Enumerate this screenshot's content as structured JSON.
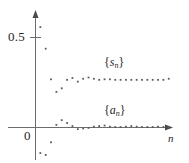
{
  "figure": {
    "name": "sequence-partial-sum-plot",
    "width": 189,
    "height": 163,
    "background_color": "#ffffff",
    "ink_color": "#5b5b5b"
  },
  "axes": {
    "x_axis_label": "n",
    "y_tick_label": "0.5",
    "origin_label": "0",
    "x_axis_pixel_y": 127,
    "y_axis_pixel_x": 35,
    "y_tick_pixel_y": 37
  },
  "labels": {
    "upper_series": {
      "open": "{",
      "var": "s",
      "sub": "n",
      "close": "}"
    },
    "lower_series": {
      "open": "{",
      "var": "a",
      "sub": "n",
      "close": "}"
    }
  },
  "chart_data": {
    "type": "scatter",
    "title": "",
    "subtitle": "",
    "xlabel": "n",
    "ylabel": "",
    "grid": false,
    "legend_position": "inline-annotation",
    "xlim": [
      0,
      26
    ],
    "ylim": [
      -0.22,
      0.62
    ],
    "yticks": [
      0.5
    ],
    "ytick_labels": [
      "0.5"
    ],
    "xticks": [],
    "annotations": [
      {
        "text": "{s_n}",
        "x": 13.0,
        "y": 0.3
      },
      {
        "text": "{a_n}",
        "x": 13.0,
        "y": 0.075
      }
    ],
    "series": [
      {
        "name": "{s_n}",
        "marker": "dot",
        "color": "#5b5b5b",
        "x": [
          1,
          2,
          3,
          4,
          5,
          6,
          7,
          8,
          9,
          10,
          11,
          12,
          13,
          14,
          15,
          16,
          17,
          18,
          19,
          20,
          21,
          22,
          23,
          24,
          25
        ],
        "y": [
          0.555,
          0.435,
          0.265,
          0.195,
          0.215,
          0.262,
          0.272,
          0.252,
          0.268,
          0.275,
          0.268,
          0.262,
          0.265,
          0.265,
          0.262,
          0.262,
          0.262,
          0.262,
          0.262,
          0.262,
          0.262,
          0.262,
          0.262,
          0.262,
          0.268
        ]
      },
      {
        "name": "{a_n}",
        "marker": "dot",
        "color": "#5b5b5b",
        "x": [
          1,
          2,
          3,
          4,
          5,
          6,
          7,
          8,
          9,
          10,
          11,
          12,
          13,
          14,
          15,
          16,
          17,
          18,
          19,
          20,
          21,
          22,
          23,
          24,
          25
        ],
        "y": [
          -0.145,
          -0.155,
          -0.085,
          0.012,
          0.038,
          0.022,
          0.005,
          -0.012,
          -0.008,
          -0.005,
          0.002,
          0.005,
          0.008,
          0.002,
          0.0,
          0.0,
          0.002,
          0.005,
          0.002,
          0.0,
          0.0,
          0.0,
          0.002,
          0.0,
          0.0
        ]
      }
    ]
  }
}
